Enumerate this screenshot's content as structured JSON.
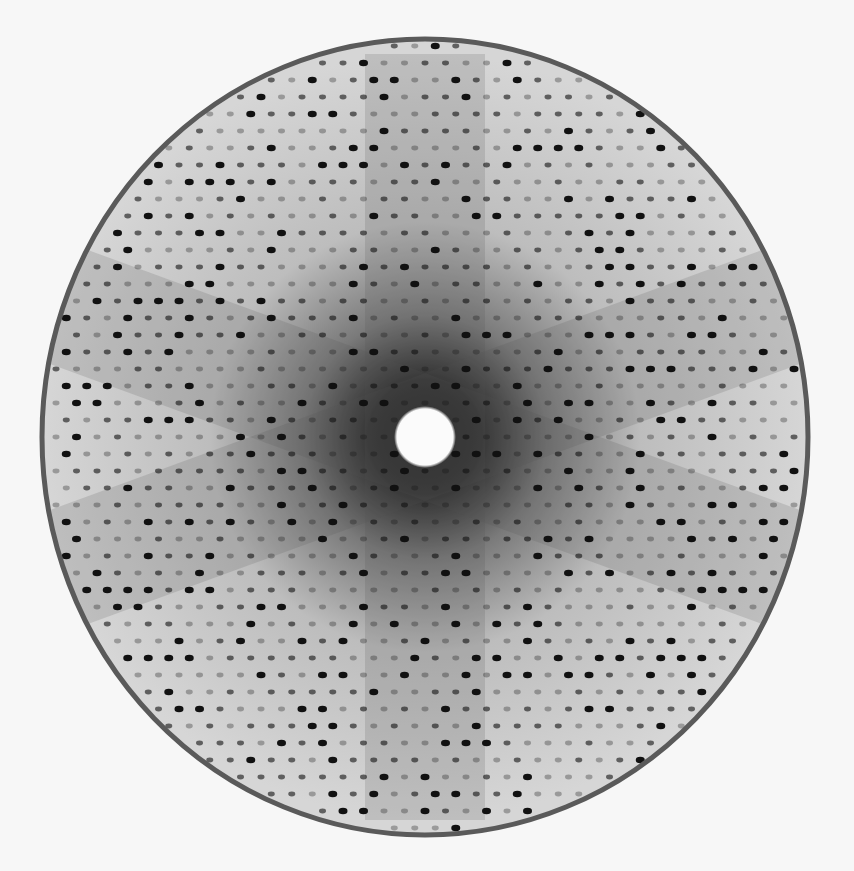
{
  "image": {
    "description": "X-ray diffraction pattern",
    "background_color": "#f7f7f7",
    "pattern": {
      "center": [
        425,
        437
      ],
      "radius_x": 383,
      "radius_y": 398,
      "rim_color": "#5a5a5a",
      "field_color": "#c8c8c8",
      "center_dark_color": "#1a1a1a",
      "beamstop_radius": 27,
      "beamstop_color": "#fbfbfb",
      "spot_color": "#111111",
      "spot_spacing_x": 20.5,
      "spot_spacing_y": 17
    }
  }
}
